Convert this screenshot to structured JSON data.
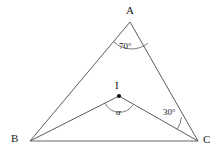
{
  "figure": {
    "kind": "geometry-triangle-diagram",
    "background_color": "#ffffff",
    "stroke_color": "#444444",
    "text_color": "#1a1a1a"
  },
  "vertices": {
    "A": {
      "label": "A",
      "x": 130,
      "y": 22
    },
    "B": {
      "label": "B",
      "x": 30,
      "y": 141
    },
    "C": {
      "label": "C",
      "x": 198,
      "y": 141
    },
    "I": {
      "label": "I",
      "x": 119,
      "y": 96
    }
  },
  "angles": {
    "at_A": {
      "label": "70°",
      "value": 70,
      "unit": "degrees"
    },
    "at_C": {
      "label": "30°",
      "value": 30,
      "unit": "degrees"
    },
    "at_I": {
      "label": "α",
      "value": null,
      "unit": "degrees"
    }
  },
  "segments": [
    {
      "name": "AB",
      "from": "A",
      "to": "B"
    },
    {
      "name": "AC",
      "from": "A",
      "to": "C"
    },
    {
      "name": "BC",
      "from": "B",
      "to": "C"
    },
    {
      "name": "BI",
      "from": "B",
      "to": "I"
    },
    {
      "name": "IC",
      "from": "I",
      "to": "C"
    }
  ]
}
